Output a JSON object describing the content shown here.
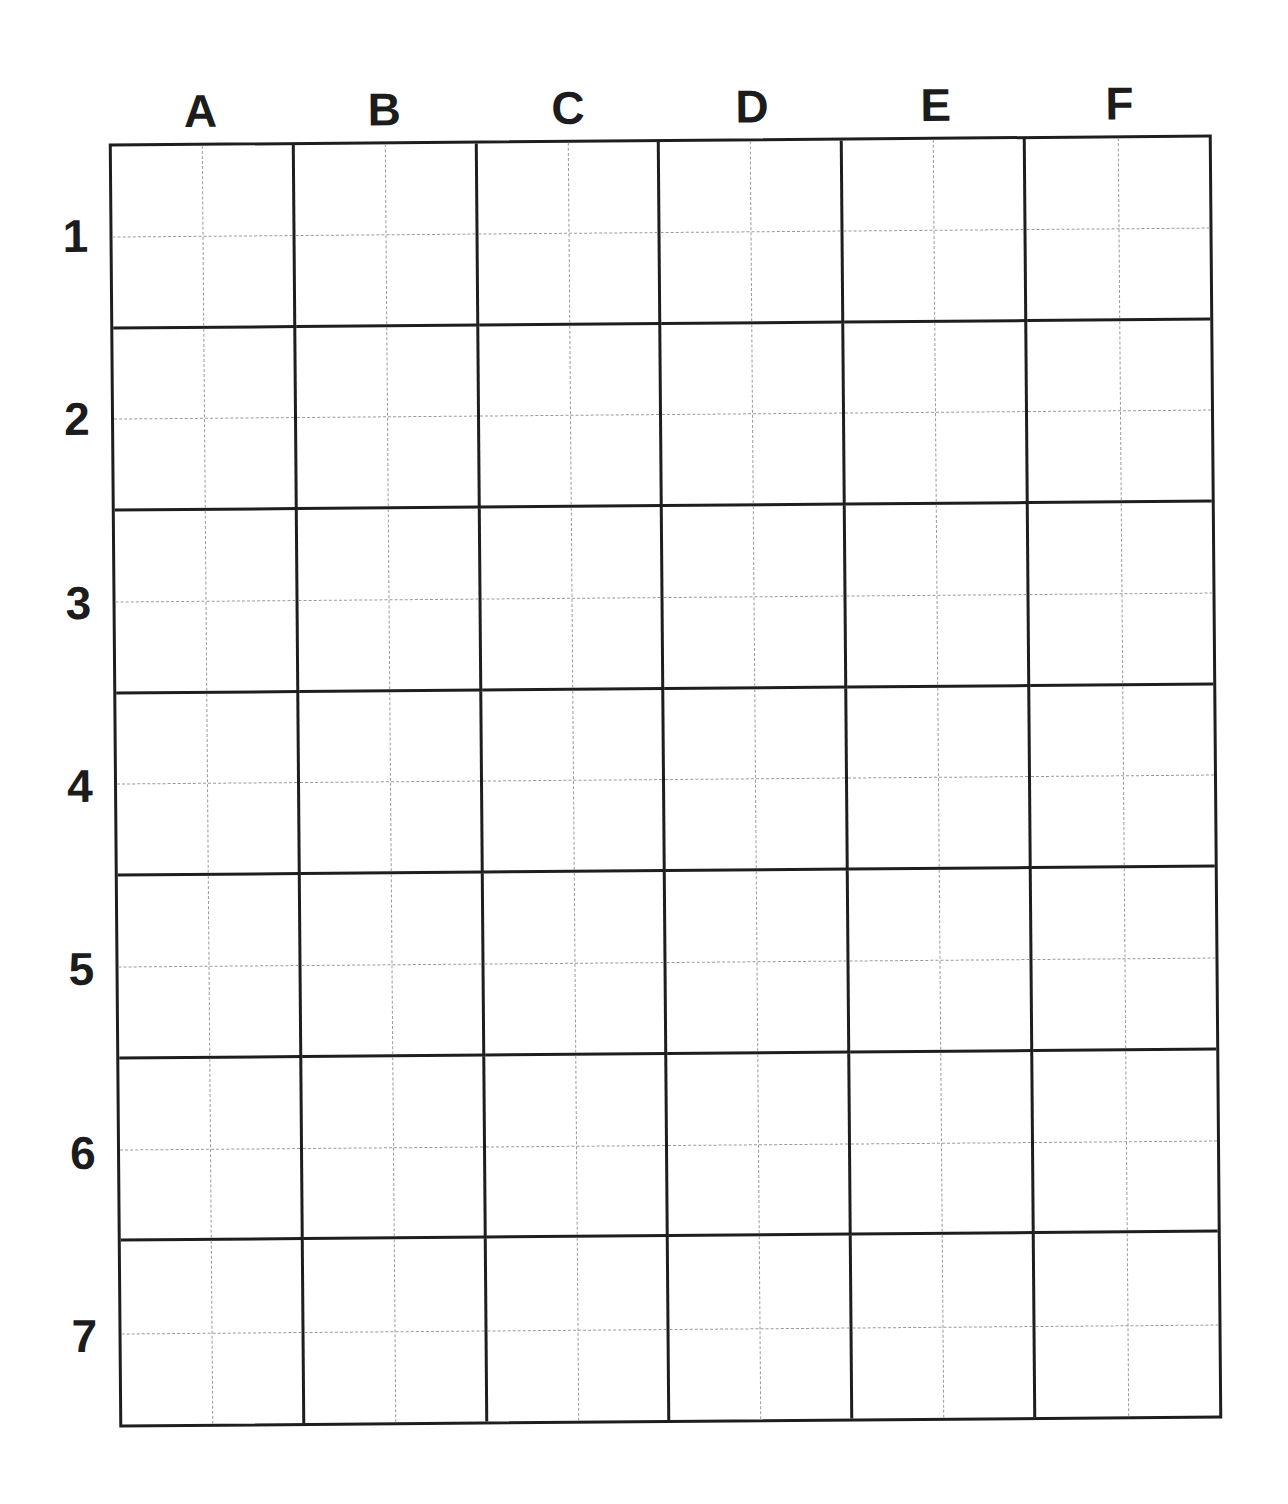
{
  "grid": {
    "columns": [
      "A",
      "B",
      "C",
      "D",
      "E",
      "F"
    ],
    "rows": [
      "1",
      "2",
      "3",
      "4",
      "5",
      "6",
      "7"
    ],
    "line_color": "#1e1e1e",
    "guide_color": "#9a9a9a"
  }
}
